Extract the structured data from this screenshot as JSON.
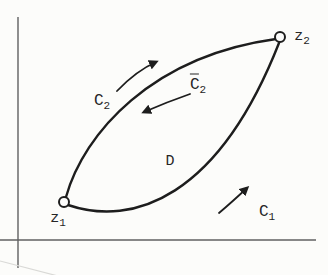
{
  "colors": {
    "background": "#fcfcfa",
    "ink": "#1d1d1d",
    "axis": "#606060"
  },
  "labels": {
    "z1": {
      "base": "z",
      "sub": "1"
    },
    "z2": {
      "base": "z",
      "sub": "2"
    },
    "c2": {
      "base": "C",
      "sub": "2"
    },
    "c2_bar": {
      "base": "C",
      "sub": "2"
    },
    "c1": {
      "base": "C",
      "sub": "1"
    },
    "region": "D"
  }
}
